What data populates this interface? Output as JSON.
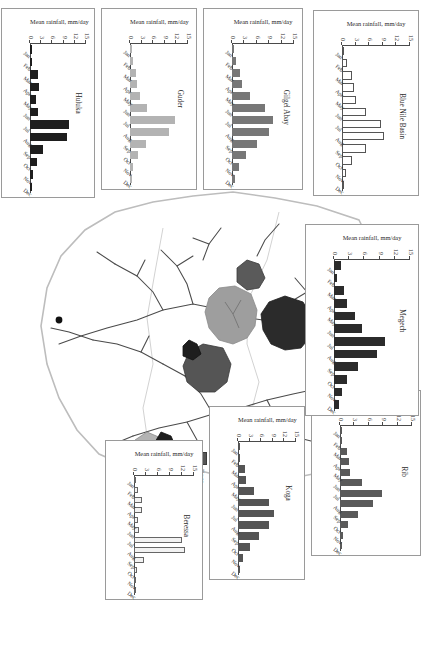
{
  "figure": {
    "ylabel": "Mean rainfall, mm/day",
    "y_ticks": [
      "15",
      "12",
      "9",
      "6",
      "3",
      "0"
    ],
    "ylim": [
      0,
      15
    ],
    "months": [
      "Jan",
      "Feb",
      "Mar",
      "Apr",
      "May",
      "Jun",
      "Jul",
      "Aug",
      "Sep",
      "Oct",
      "Nov",
      "Dec"
    ]
  },
  "colors": {
    "megech": "#2b2b2b",
    "rib": "#5a5a5a",
    "blue_nile_basin": "#ffffff",
    "gilgel_abay": "#777777",
    "guder": "#b3b3b3",
    "huluka": "#1e1e1e",
    "koga": "#555555",
    "beressa": "#f2f2f2",
    "lake_tana": "#9e9e9e",
    "outline": "#3a3a3a",
    "river": "#4a4a4a"
  },
  "chart_data": [
    {
      "type": "bar",
      "title": "Rib",
      "ylabel": "Mean rainfall, mm/day",
      "xlabel": "",
      "ylim": [
        0,
        15
      ],
      "grid": false,
      "color": "#5a5a5a",
      "categories": [
        "Jan",
        "Feb",
        "Mar",
        "Apr",
        "May",
        "Jun",
        "Jul",
        "Aug",
        "Sep",
        "Oct",
        "Nov",
        "Dec"
      ],
      "values": [
        0.3,
        0.5,
        1.4,
        1.8,
        2.0,
        4.6,
        8.7,
        6.8,
        3.7,
        1.6,
        0.6,
        0.3
      ]
    },
    {
      "type": "bar",
      "title": "Koga",
      "ylabel": "Mean rainfall, mm/day",
      "xlabel": "",
      "ylim": [
        0,
        15
      ],
      "grid": false,
      "color": "#555555",
      "categories": [
        "Jan",
        "Feb",
        "Mar",
        "Apr",
        "May",
        "Jun",
        "Jul",
        "Aug",
        "Sep",
        "Oct",
        "Nov",
        "Dec"
      ],
      "values": [
        0.2,
        0.6,
        1.8,
        2.0,
        4.2,
        7.9,
        9.3,
        8.1,
        5.4,
        3.2,
        1.4,
        0.4
      ]
    },
    {
      "type": "bar",
      "title": "Beressa",
      "ylabel": "Mean rainfall, mm/day",
      "xlabel": "",
      "ylim": [
        0,
        15
      ],
      "grid": false,
      "color": "#f2f2f2",
      "categories": [
        "Jan",
        "Feb",
        "Mar",
        "Apr",
        "May",
        "Jun",
        "Jul",
        "Aug",
        "Sep",
        "Oct",
        "Nov",
        "Dec"
      ],
      "values": [
        0.4,
        0.9,
        1.9,
        2.1,
        1.0,
        1.2,
        12.0,
        12.8,
        2.4,
        0.7,
        0.3,
        0.2
      ]
    },
    {
      "type": "bar",
      "title": "Megech",
      "ylabel": "Mean rainfall, mm/day",
      "xlabel": "",
      "ylim": [
        0,
        15
      ],
      "grid": false,
      "color": "#2b2b2b",
      "categories": [
        "Jan",
        "Feb",
        "Mar",
        "Apr",
        "May",
        "Jun",
        "Jul",
        "Aug",
        "Sep",
        "Oct",
        "Nov",
        "Dec"
      ],
      "values": [
        1.4,
        0.5,
        1.9,
        2.6,
        4.2,
        5.6,
        10.1,
        8.5,
        4.8,
        2.6,
        1.5,
        0.9
      ]
    },
    {
      "type": "bar",
      "title": "Blue Nile Basin",
      "ylabel": "Mean rainfall, mm/day",
      "xlabel": "",
      "ylim": [
        0,
        15
      ],
      "grid": false,
      "color": "#ffffff",
      "categories": [
        "Jan",
        "Feb",
        "Mar",
        "Apr",
        "May",
        "Jun",
        "Jul",
        "Aug",
        "Sep",
        "Oct",
        "Nov",
        "Dec"
      ],
      "values": [
        0.5,
        1.1,
        2.1,
        2.7,
        3.2,
        5.4,
        8.6,
        9.3,
        5.2,
        2.2,
        0.9,
        0.5
      ]
    },
    {
      "type": "bar",
      "title": "Gilgel Abay",
      "ylabel": "Mean rainfall, mm/day",
      "xlabel": "",
      "ylim": [
        0,
        15
      ],
      "grid": false,
      "color": "#777777",
      "categories": [
        "Jan",
        "Feb",
        "Mar",
        "Apr",
        "May",
        "Jun",
        "Jul",
        "Aug",
        "Sep",
        "Oct",
        "Nov",
        "Dec"
      ],
      "values": [
        0.6,
        0.9,
        2.0,
        2.4,
        4.4,
        8.1,
        10.0,
        8.9,
        6.1,
        3.4,
        1.6,
        0.7
      ]
    },
    {
      "type": "bar",
      "title": "Guder",
      "ylabel": "Mean rainfall, mm/day",
      "xlabel": "",
      "ylim": [
        0,
        15
      ],
      "grid": false,
      "color": "#b3b3b3",
      "categories": [
        "Jan",
        "Feb",
        "Mar",
        "Apr",
        "May",
        "Jun",
        "Jul",
        "Aug",
        "Sep",
        "Oct",
        "Nov",
        "Dec"
      ],
      "values": [
        0.4,
        0.7,
        1.6,
        1.9,
        2.6,
        4.4,
        11.6,
        10.2,
        4.2,
        2.1,
        0.9,
        0.4
      ]
    },
    {
      "type": "bar",
      "title": "Huluka",
      "ylabel": "Mean rainfall, mm/day",
      "xlabel": "",
      "ylim": [
        0,
        15
      ],
      "grid": false,
      "color": "#1e1e1e",
      "categories": [
        "Jan",
        "Feb",
        "Mar",
        "Apr",
        "May",
        "Jun",
        "Jul",
        "Aug",
        "Sep",
        "Oct",
        "Nov",
        "Dec"
      ],
      "values": [
        0.5,
        0.6,
        2.1,
        2.3,
        1.7,
        2.2,
        10.4,
        10.0,
        3.6,
        1.9,
        0.8,
        0.5
      ]
    }
  ],
  "map_legend": {
    "items": [
      {
        "label": "Hydro stations",
        "symbol": "dot",
        "color": "#111111"
      },
      {
        "label": "River system",
        "symbol": "line",
        "color": "#4a4a4a"
      },
      {
        "label": "Lake Tana",
        "symbol": "swatch",
        "color": "#9e9e9e"
      },
      {
        "label": "Beressa",
        "symbol": "swatch",
        "color": "#f2f2f2"
      }
    ]
  },
  "basin_legend_a": {
    "items": [
      {
        "label": "Gilgel Abay",
        "color": "#777777"
      },
      {
        "label": "Guder",
        "color": "#b3b3b3"
      },
      {
        "label": "Huluka",
        "color": "#1e1e1e"
      },
      {
        "label": "Koga",
        "color": "#555555"
      }
    ]
  },
  "basin_legend_b": {
    "items": [
      {
        "label": "Megech",
        "color": "#2b2b2b"
      },
      {
        "label": "Rib",
        "color": "#5a5a5a"
      },
      {
        "label": "Blue Nile Basin",
        "color": "#ffffff"
      }
    ]
  }
}
